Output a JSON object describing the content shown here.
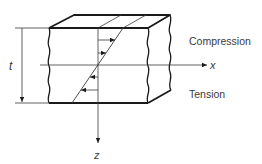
{
  "diagram": {
    "labels": {
      "thickness": "t",
      "x_axis": "x",
      "z_axis": "z",
      "top_region": "Compression",
      "bottom_region": "Tension"
    },
    "colors": {
      "line": "#1a1a1a",
      "thin_line": "#3a3a3a",
      "text": "#3a3a3a",
      "background": "#ffffff"
    }
  }
}
